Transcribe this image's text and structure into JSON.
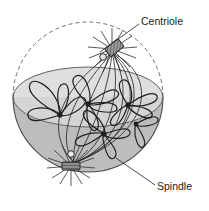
{
  "labels": [
    {
      "id": "centriole",
      "text": "Centriole",
      "x": 141,
      "y": 22,
      "leader": "M139,24 L100,52"
    },
    {
      "id": "spindle",
      "text": "Spindle",
      "x": 157,
      "y": 187,
      "leader": "M155,185 L116,158"
    }
  ],
  "colors": {
    "outline": "#3a3a3a",
    "stroke": "#2b2b2b",
    "lower_hemisphere_fill": "#b9b9b9",
    "equator_fill": "#d2d2d2",
    "upper_fill": "#ffffff",
    "centriole_fill": "#8a8a8a",
    "background": "#ffffff",
    "text": "#1a1a1a"
  },
  "structures": {
    "cell_membrane_upper": "dashed arc",
    "cell_membrane_lower": "solid shaded hemisphere",
    "centriole_top": {
      "cx": 112,
      "cy": 49,
      "shape": "hatched-cylinder",
      "aster_rays": 14
    },
    "centriole_bottom": {
      "cx": 71,
      "cy": 166,
      "shape": "hatched-bar",
      "aster_rays": 14
    },
    "chromosome_count": 5,
    "spindle_fiber_count": 8
  }
}
